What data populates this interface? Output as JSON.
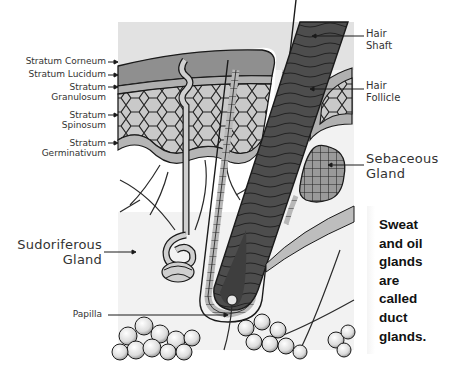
{
  "diagram": {
    "labels": {
      "stratum_corneum": "Stratum Corneum",
      "stratum_lucidum": "Stratum Lucidum",
      "stratum_granulosum_1": "Stratum",
      "stratum_granulosum_2": "Granulosum",
      "stratum_spinosum_1": "Stratum",
      "stratum_spinosum_2": "Spinosum",
      "stratum_germinativum_1": "Stratum",
      "stratum_germinativum_2": "Germinativum",
      "hair_shaft_1": "Hair",
      "hair_shaft_2": "Shaft",
      "hair_follicle_1": "Hair",
      "hair_follicle_2": "Follicle",
      "sebaceous_gland_1": "Sebaceous",
      "sebaceous_gland_2": "Gland",
      "sudoriferous_gland_1": "Sudoriferous",
      "sudoriferous_gland_2": "Gland",
      "papilla": "Papilla"
    },
    "note": {
      "lines": [
        "Sweat",
        "and oil",
        "glands",
        "are",
        "called",
        "duct",
        "glands."
      ]
    },
    "colors": {
      "epidermis_top": "#8f8f8f",
      "cells": "#c8c8c8",
      "hair_dark": "#4a4a4a",
      "outline": "#1a1a1a",
      "sheath": "#b5b5b5"
    }
  }
}
